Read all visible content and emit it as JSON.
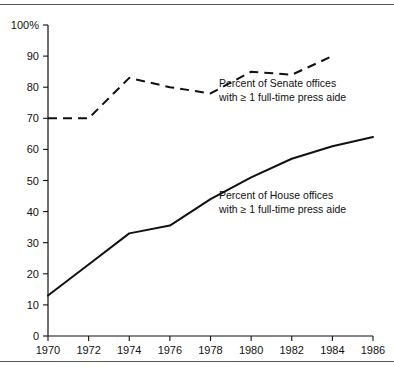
{
  "chart_data": {
    "type": "line",
    "title": "",
    "subtitle": "",
    "xlabel": "",
    "ylabel": "",
    "x": [
      1970,
      1972,
      1974,
      1976,
      1978,
      1980,
      1982,
      1984,
      1986
    ],
    "xtick_labels": [
      "1970",
      "1972",
      "1974",
      "1976",
      "1978",
      "1980",
      "1982",
      "1984",
      "1986"
    ],
    "ytick_labels": [
      "0",
      "10",
      "20",
      "30",
      "40",
      "50",
      "60",
      "70",
      "80",
      "90",
      "100%"
    ],
    "ytick_values": [
      0,
      10,
      20,
      30,
      40,
      50,
      60,
      70,
      80,
      90,
      100
    ],
    "xlim": [
      1970,
      1986
    ],
    "ylim": [
      0,
      100
    ],
    "grid": false,
    "legend_position": "inline-annotation",
    "series": [
      {
        "name": "Percent of Senate offices with ≥ 1 full-time press aide",
        "style": "dashed",
        "color": "#111111",
        "x": [
          1970,
          1972,
          1974,
          1976,
          1978,
          1980,
          1982,
          1984
        ],
        "values": [
          70,
          70,
          83,
          80,
          78,
          85,
          84,
          90
        ]
      },
      {
        "name": "Percent of House offices with ≥ 1 full-time press aide",
        "style": "solid",
        "color": "#111111",
        "x": [
          1970,
          1972,
          1974,
          1976,
          1978,
          1980,
          1982,
          1984,
          1986
        ],
        "values": [
          13,
          23,
          33,
          35.5,
          44,
          51,
          57,
          61,
          64
        ]
      }
    ],
    "annotations": [
      {
        "name": "senate-annotation",
        "line1": "Percent of Senate offices",
        "line2": "with ≥ 1 full-time press aide"
      },
      {
        "name": "house-annotation",
        "line1": "Percent of House offices",
        "line2": "with ≥ 1 full-time press aide"
      }
    ]
  }
}
